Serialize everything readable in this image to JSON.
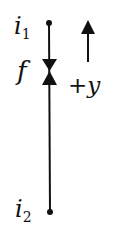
{
  "diagram": {
    "type": "edge-with-feature",
    "labels": {
      "top_node": "i",
      "top_node_sub": "1",
      "bottom_node": "i",
      "bottom_node_sub": "2",
      "feature": "f",
      "direction": "+y"
    },
    "colors": {
      "stroke": "#111111",
      "background": "#ffffff"
    }
  }
}
